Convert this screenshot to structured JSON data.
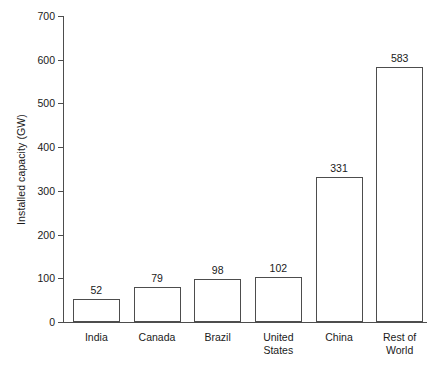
{
  "chart_data": {
    "type": "bar",
    "title": "",
    "xlabel": "",
    "ylabel": "Installed capacity (GW)",
    "categories": [
      "India",
      "Canada",
      "Brazil",
      "United States",
      "China",
      "Rest of World"
    ],
    "category_lines": [
      [
        "India"
      ],
      [
        "Canada"
      ],
      [
        "Brazil"
      ],
      [
        "United",
        "States"
      ],
      [
        "China"
      ],
      [
        "Rest of",
        "World"
      ]
    ],
    "values": [
      52,
      79,
      98,
      102,
      331,
      583
    ],
    "value_labels": [
      "52",
      "79",
      "98",
      "102",
      "331",
      "583"
    ],
    "ylim": [
      0,
      700
    ],
    "yticks": [
      0,
      100,
      200,
      300,
      400,
      500,
      600,
      700
    ],
    "ytick_labels": [
      "0",
      "100",
      "200",
      "300",
      "400",
      "500",
      "600",
      "700"
    ],
    "grid": false,
    "legend": false,
    "bar_fill": "#ffffff",
    "bar_edge": "#4d4d4d",
    "axis_color": "#4d4d4d",
    "text_color": "#1a1a1a",
    "background": "#ffffff"
  }
}
